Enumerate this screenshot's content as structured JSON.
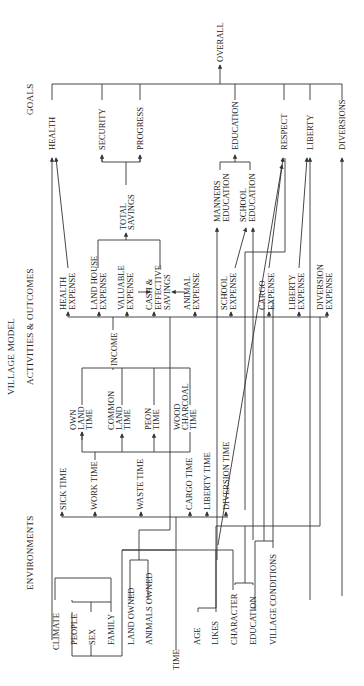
{
  "title": "VILLAGE MODEL",
  "columns": {
    "goals": "GOALS",
    "activities": "ACTIVITIES & OUTCOMES",
    "environments": "ENVIRONMENTS"
  },
  "overall": "OVERALL",
  "goals": [
    "HEALTH",
    "SECURITY",
    "PROGRESS",
    "EDUCATION",
    "RESPECT",
    "LIBERTY",
    "DIVERSIONS"
  ],
  "intermediate": {
    "total_savings": [
      "TOTAL",
      "SAVINGS"
    ],
    "manners_education": [
      "MANNERS",
      "EDUCATION"
    ],
    "school_education": [
      "SCHOOL",
      "EDUCATION"
    ]
  },
  "expenses": [
    [
      "HEALTH",
      "EXPENSE"
    ],
    [
      "LAND HOUSE",
      "EXPENSE"
    ],
    [
      "VALUABLE",
      "EXPENSE"
    ],
    [
      "CASH &",
      "EFFECTIVE",
      "SAVINGS"
    ],
    [
      "ANIMAL",
      "EXPENSE"
    ],
    [
      "SCHOOL",
      "EXPENSE"
    ],
    [
      "CARGO",
      "EXPENSE"
    ],
    [
      "LIBERTY",
      "EXPENSE"
    ],
    [
      "DIVERSION",
      "EXPENSE"
    ]
  ],
  "income": "INCOME",
  "work_types": [
    [
      "OWN",
      "LAND",
      "TIME"
    ],
    [
      "COMMON",
      "LAND",
      "TIME"
    ],
    [
      "PEON",
      "TIME"
    ],
    [
      "WOOD",
      "CHARCOAL",
      "TIME"
    ]
  ],
  "time_uses": [
    "SICK TIME",
    "WORK TIME",
    "WASTE TIME",
    "CARGO TIME",
    "LIBERTY TIME",
    "DIVERSION TIME"
  ],
  "environments": [
    "CLIMATE",
    "PEOPLE",
    "SEX",
    "FAMILY",
    "LAND OWNED",
    "ANIMALS OWNED",
    "TIME",
    "AGE",
    "LIKES",
    "CHARACTER",
    "EDUCATION",
    "VILLAGE CONDITIONS"
  ]
}
